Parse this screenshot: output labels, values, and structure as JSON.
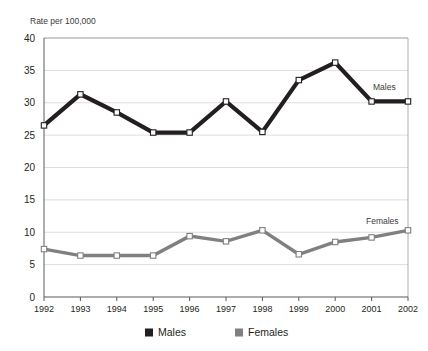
{
  "chart_data": {
    "type": "line",
    "title": "",
    "subtitle": "",
    "ylabel": "Rate per 100,000",
    "xlabel": "",
    "ylim": [
      0,
      40
    ],
    "y_ticks": [
      0,
      5,
      10,
      15,
      20,
      25,
      30,
      35,
      40
    ],
    "y_tick_labels": [
      "0",
      "5",
      "10",
      "15",
      "20",
      "25",
      "30",
      "35",
      "40"
    ],
    "grid": true,
    "legend_position": "bottom",
    "categories": [
      "1992",
      "1993",
      "1994",
      "1995",
      "1996",
      "1997",
      "1998",
      "1999",
      "2000",
      "2001",
      "2002"
    ],
    "series": [
      {
        "name": "Males",
        "color": "#231f20",
        "marker": "square-open",
        "inline_label": "Males",
        "values": [
          26.5,
          31.3,
          28.5,
          25.4,
          25.4,
          30.2,
          25.5,
          33.5,
          36.2,
          30.2,
          30.2
        ]
      },
      {
        "name": "Females",
        "color": "#808080",
        "marker": "square-open",
        "inline_label": "Females",
        "values": [
          7.4,
          6.4,
          6.4,
          6.4,
          9.4,
          8.6,
          10.3,
          6.6,
          8.5,
          9.2,
          10.3
        ]
      }
    ]
  },
  "legend": {
    "items": [
      {
        "label": "Males",
        "color": "#231f20"
      },
      {
        "label": "Females",
        "color": "#808080"
      }
    ]
  },
  "colors": {
    "males": "#231f20",
    "females": "#808080",
    "gridline": "#cfcfcf",
    "axis": "#5a5a5a",
    "marker_fill": "#ffffff",
    "background": "#ffffff"
  }
}
